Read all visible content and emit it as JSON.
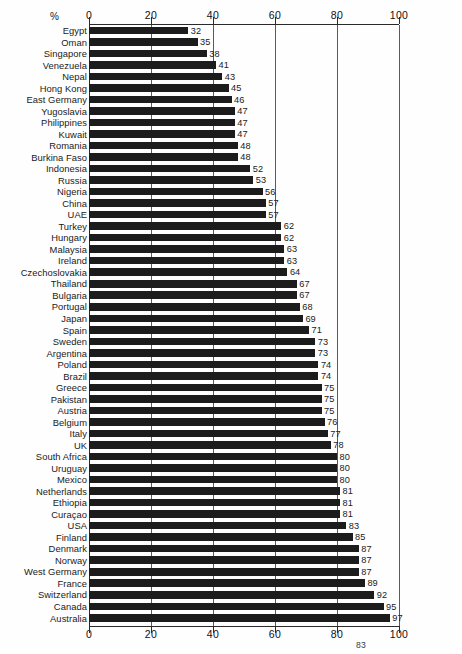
{
  "chart_data": {
    "type": "bar",
    "orientation": "horizontal",
    "title": "",
    "xlabel": "%",
    "ylabel": "",
    "xlim": [
      0,
      100
    ],
    "xticks": [
      0,
      20,
      40,
      60,
      80,
      100
    ],
    "grid": true,
    "legend": null,
    "axis_top_labels": [
      "0",
      "20",
      "40",
      "60",
      "80",
      "100"
    ],
    "axis_bottom_labels": [
      "0",
      "20",
      "40",
      "60",
      "80",
      "100"
    ],
    "percent_symbol": "%",
    "categories": [
      "Egypt",
      "Oman",
      "Singapore",
      "Venezuela",
      "Nepal",
      "Hong Kong",
      "East Germany",
      "Yugoslavia",
      "Philippines",
      "Kuwait",
      "Romania",
      "Burkina Faso",
      "Indonesia",
      "Russia",
      "Nigeria",
      "China",
      "UAE",
      "Turkey",
      "Hungary",
      "Malaysia",
      "Ireland",
      "Czechoslovakia",
      "Thailand",
      "Bulgaria",
      "Portugal",
      "Japan",
      "Spain",
      "Sweden",
      "Argentina",
      "Poland",
      "Brazil",
      "Greece",
      "Pakistan",
      "Austria",
      "Belgium",
      "Italy",
      "UK",
      "South Africa",
      "Uruguay",
      "Mexico",
      "Netherlands",
      "Ethiopia",
      "Curaçao",
      "USA",
      "Finland",
      "Denmark",
      "Norway",
      "West Germany",
      "France",
      "Switzerland",
      "Canada",
      "Australia"
    ],
    "values": [
      32,
      35,
      38,
      41,
      43,
      45,
      46,
      47,
      47,
      47,
      48,
      48,
      52,
      53,
      56,
      57,
      57,
      62,
      62,
      63,
      63,
      64,
      67,
      67,
      68,
      69,
      71,
      73,
      73,
      74,
      74,
      75,
      75,
      75,
      76,
      77,
      78,
      80,
      80,
      80,
      81,
      81,
      81,
      83,
      85,
      87,
      87,
      87,
      89,
      92,
      95,
      97
    ]
  },
  "page": {
    "number": "83"
  }
}
